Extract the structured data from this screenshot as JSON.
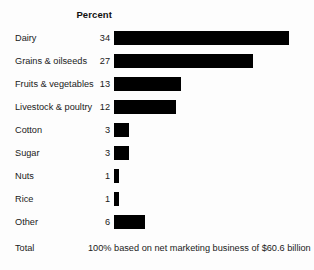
{
  "header": {
    "percent_label": "Percent"
  },
  "footer": {
    "label": "Total",
    "note": "100% based on net marketing business of $60.6 billion"
  },
  "style": {
    "bar_color": "#000000",
    "background": "#fdfdfd",
    "px_per_percent": 5.15,
    "bar_left": 114
  },
  "chart_data": {
    "type": "bar",
    "orientation": "horizontal",
    "title": "",
    "xlabel": "Percent",
    "ylabel": "",
    "grid": false,
    "legend": false,
    "value_suffix": "",
    "categories": [
      "Dairy",
      "Grains & oilseeds",
      "Fruits & vegetables",
      "Livestock & poultry",
      "Cotton",
      "Sugar",
      "Nuts",
      "Rice",
      "Other"
    ],
    "values": [
      34,
      27,
      13,
      12,
      3,
      3,
      1,
      1,
      6
    ],
    "xlim": [
      0,
      34
    ],
    "total_label": "Total",
    "total_note": "100% based on net marketing business of $60.6 billion",
    "rows": [
      {
        "label": "Dairy",
        "value": 34,
        "value_text": "34"
      },
      {
        "label": "Grains & oilseeds",
        "value": 27,
        "value_text": "27"
      },
      {
        "label": "Fruits & vegetables",
        "value": 13,
        "value_text": "13"
      },
      {
        "label": "Livestock & poultry",
        "value": 12,
        "value_text": "12"
      },
      {
        "label": "Cotton",
        "value": 3,
        "value_text": "3"
      },
      {
        "label": "Sugar",
        "value": 3,
        "value_text": "3"
      },
      {
        "label": "Nuts",
        "value": 1,
        "value_text": "1"
      },
      {
        "label": "Rice",
        "value": 1,
        "value_text": "1"
      },
      {
        "label": "Other",
        "value": 6,
        "value_text": "6"
      }
    ]
  }
}
